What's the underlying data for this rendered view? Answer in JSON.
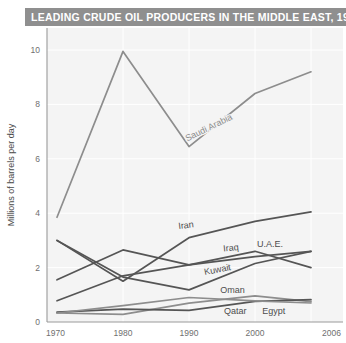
{
  "title": "LEADING CRUDE OIL PRODUCERS IN THE MIDDLE EAST, 1970-2006",
  "colors": {
    "title_bar": "#8f8f8f",
    "title_text": "#ffffff",
    "plot_background": "#f4f4f4",
    "gridline": "#ffffff",
    "axis": "#9a9a9a",
    "dark_series": "#555555",
    "light_series": "#8d8d8d",
    "tick_text": "#6f6f6f"
  },
  "chart_data": {
    "type": "line",
    "title": "LEADING CRUDE OIL PRODUCERS IN THE MIDDLE EAST, 1970-2006",
    "xlabel": "",
    "ylabel": "Millions of barrels per day",
    "x": [
      1970,
      1980,
      1990,
      2000,
      2006
    ],
    "xtick_labels": [
      "1970",
      "1980",
      "1990",
      "2000",
      "2006"
    ],
    "ytick_labels": [
      "0",
      "2",
      "4",
      "6",
      "8",
      "10"
    ],
    "yticks": [
      0,
      2,
      4,
      6,
      8,
      10
    ],
    "ylim": [
      0,
      10.8
    ],
    "xlim": [
      1970,
      2006
    ],
    "grid": true,
    "legend": "inline-labels",
    "series": [
      {
        "name": "Saudi Arabia",
        "values": [
          3.85,
          9.95,
          6.45,
          8.4,
          9.2
        ],
        "color": "#8d8d8d",
        "label_style": "light",
        "label_x": 1993.2,
        "label_y": 7.05,
        "label_rotation": -26
      },
      {
        "name": "Iran",
        "values": [
          3.0,
          1.5,
          3.1,
          3.7,
          4.05
        ],
        "color": "#555555",
        "label_style": "dark",
        "label_x": 1989.6,
        "label_y": 3.45,
        "label_rotation": -7
      },
      {
        "name": "Iraq",
        "values": [
          1.55,
          2.65,
          2.1,
          2.6,
          2.0
        ],
        "color": "#555555",
        "label_style": "dark",
        "label_x": 1996.4,
        "label_y": 2.62,
        "label_rotation": -6
      },
      {
        "name": "Kuwait",
        "values": [
          3.0,
          1.65,
          1.18,
          2.15,
          2.6
        ],
        "color": "#555555",
        "label_style": "dark",
        "label_x": 1994.4,
        "label_y": 1.82,
        "label_rotation": -11
      },
      {
        "name": "U.A.E.",
        "values": [
          0.78,
          1.7,
          2.1,
          2.4,
          2.6
        ],
        "color": "#555555",
        "label_style": "dark",
        "label_x": 2001.6,
        "label_y": 2.75,
        "label_rotation": 0
      },
      {
        "name": "Oman",
        "values": [
          0.33,
          0.28,
          0.69,
          0.96,
          0.75
        ],
        "color": "#8d8d8d",
        "label_style": "dark",
        "label_x": 1996.6,
        "label_y": 1.08,
        "label_rotation": 0
      },
      {
        "name": "Qatar",
        "values": [
          0.36,
          0.47,
          0.43,
          0.76,
          0.82
        ],
        "color": "#555555",
        "label_style": "dark",
        "label_x": 1997.0,
        "label_y": 0.28,
        "label_rotation": 0
      },
      {
        "name": "Egypt",
        "values": [
          0.33,
          0.6,
          0.9,
          0.78,
          0.7
        ],
        "color": "#8d8d8d",
        "label_style": "dark",
        "label_x": 2002.0,
        "label_y": 0.3,
        "label_rotation": 0
      }
    ]
  }
}
